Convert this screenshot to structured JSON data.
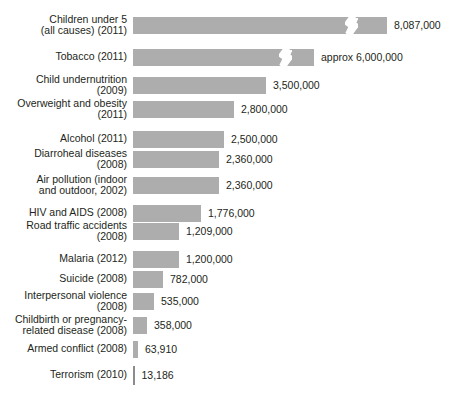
{
  "chart_data": {
    "type": "bar",
    "orientation": "horizontal",
    "title": "",
    "xlabel": "",
    "ylabel": "",
    "grid": false,
    "legend": false,
    "axis_note": "Top two bars are drawn truncated with a zigzag axis-break symbol; their plotted length is shorter than true scale.",
    "px_per_million": 38,
    "bar_origin_px": 139,
    "categories": [
      "Children under 5\n(all causes) (2011)",
      "Tobacco (2011)",
      "Child undernutrition\n(2009)",
      "Overweight and obesity\n(2011)",
      "Alcohol (2011)",
      "Diarroheal diseases\n(2008)",
      "Air pollution (indoor\nand outdoor, 2002)",
      "HIV and AIDS (2008)",
      "Road traffic accidents\n(2008)",
      "Malaria (2012)",
      "Suicide (2008)",
      "Interpersonal violence\n(2008)",
      "Childbirth or pregnancy-\nrelated disease (2008)",
      "Armed conflict (2008)",
      "Terrorism (2010)"
    ],
    "values": [
      8087000,
      6000000,
      3500000,
      2800000,
      2500000,
      2360000,
      2360000,
      1776000,
      1209000,
      1200000,
      782000,
      535000,
      358000,
      63910,
      13186
    ],
    "value_labels": [
      "8,087,000",
      "approx 6,000,000",
      "3,500,000",
      "2,800,000",
      "2,500,000",
      "2,360,000",
      "2,360,000",
      "1,776,000",
      "1,209,000",
      "1,200,000",
      "782,000",
      "535,000",
      "358,000",
      "63,910",
      "13,186"
    ],
    "bar_px": [
      254,
      181,
      133,
      101,
      91,
      86,
      86,
      68,
      46,
      46,
      30,
      21,
      14,
      5,
      1.5
    ],
    "broken": [
      true,
      true,
      false,
      false,
      false,
      false,
      false,
      false,
      false,
      false,
      false,
      false,
      false,
      false,
      false
    ],
    "break_at_px": [
      212,
      146,
      0,
      0,
      0,
      0,
      0,
      0,
      0,
      0,
      0,
      0,
      0,
      0,
      0
    ],
    "row_tops": [
      12,
      44,
      72,
      96,
      126,
      146,
      172,
      200,
      218,
      246,
      266,
      288,
      312,
      336,
      362
    ]
  },
  "colors": {
    "bar": "#adadad",
    "background": "#ffffff",
    "text": "#231f20",
    "tick": "#8c8c8c"
  }
}
